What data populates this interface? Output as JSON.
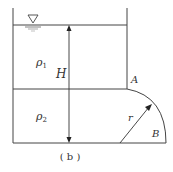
{
  "figure": {
    "caption": "( b )",
    "labels": {
      "rho1": "ρ",
      "rho1_sub": "1",
      "rho2": "ρ",
      "rho2_sub": "2",
      "height": "H",
      "point_a": "A",
      "point_b": "B",
      "radius": "r"
    },
    "icons": {
      "free_surface": "free-surface-triangle-icon"
    },
    "colors": {
      "line": "#333333",
      "background": "#ffffff"
    }
  }
}
